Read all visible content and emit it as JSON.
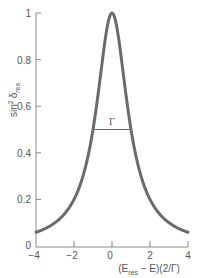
{
  "chart_data": {
    "type": "line",
    "title": "",
    "xlabel": "(E_res − E)(2/Γ)",
    "ylabel": "sin² δ_res",
    "xlim": [
      -4,
      4
    ],
    "ylim": [
      0,
      1
    ],
    "x_ticks": [
      "−4",
      "−2",
      "0",
      "2",
      "4"
    ],
    "y_ticks": [
      "0",
      "0.2",
      "0.4",
      "0.6",
      "0.8",
      "1"
    ],
    "grid": false,
    "series": [
      {
        "name": "Lorentzian resonance 1/(1+x²)",
        "x": [
          -4,
          -3,
          -2,
          -1.5,
          -1,
          -0.5,
          0,
          0.5,
          1,
          1.5,
          2,
          3,
          4
        ],
        "values": [
          0.059,
          0.1,
          0.2,
          0.308,
          0.5,
          0.8,
          1.0,
          0.8,
          0.5,
          0.308,
          0.2,
          0.1,
          0.059
        ]
      }
    ],
    "annotations": [
      {
        "text": "Γ",
        "type": "width-bar",
        "x_from": -1,
        "x_to": 1,
        "y": 0.5
      }
    ],
    "colors": {
      "curve": "#6b6b6b",
      "axis": "#8a8a8a",
      "text": "#555555"
    }
  },
  "labels": {
    "ylabel_main": "sin",
    "ylabel_sup": "2",
    "ylabel_delta": "δ",
    "ylabel_sub": "res",
    "xlabel_open": "(E",
    "xlabel_sub": "res",
    "xlabel_rest": " − E)(2/Γ)",
    "gamma": "Γ",
    "x0": "−4",
    "x1": "−2",
    "x2": "0",
    "x3": "2",
    "x4": "4",
    "y0": "0",
    "y1": "0.2",
    "y2": "0.4",
    "y3": "0.6",
    "y4": "0.8",
    "y5": "1"
  }
}
